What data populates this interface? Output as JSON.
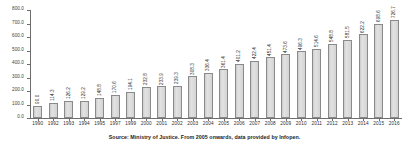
{
  "chart_data": {
    "type": "bar",
    "title": "",
    "xlabel": "",
    "ylabel": "",
    "ylim": [
      0,
      800
    ],
    "grid": false,
    "legend": "none",
    "categories": [
      "1990",
      "1992",
      "1993",
      "1994",
      "1995",
      "1997",
      "1999",
      "2000",
      "2001",
      "2002",
      "2003",
      "2004",
      "2005",
      "2006",
      "2007",
      "2008",
      "2009",
      "2010",
      "2011",
      "2012",
      "2013",
      "2014",
      "2015",
      "2016"
    ],
    "values": [
      90.0,
      114.3,
      126.2,
      129.2,
      148.8,
      170.6,
      194.1,
      232.8,
      233.9,
      239.3,
      308.3,
      336.4,
      361.4,
      401.2,
      422.4,
      451.4,
      473.6,
      496.3,
      514.6,
      548.8,
      581.5,
      622.2,
      698.6,
      726.7
    ],
    "value_labels": [
      "90.0",
      "114.3",
      "126.2",
      "129.2",
      "148.8",
      "170.6",
      "194.1",
      "232.8",
      "233.9",
      "239.3",
      "308.3",
      "336.4",
      "361.4",
      "401.2",
      "422.4",
      "451.4",
      "473.6",
      "496.3",
      "514.6",
      "548.8",
      "581.5",
      "622.2",
      "698.6",
      "726.7"
    ],
    "ytick_labels": [
      "0.0",
      "100.0",
      "200.0",
      "300.0",
      "400.0",
      "500.0",
      "600.0",
      "700.0",
      "800.0"
    ],
    "ytick_values": [
      0,
      100,
      200,
      300,
      400,
      500,
      600,
      700,
      800
    ],
    "bar_color": "#d8d8d8",
    "bar_edge_color": "#8a8a8a",
    "axis_color": "#6e6e6e"
  },
  "source_note": "Source: Ministry of Justice. From 2005 onwards, data provided by Infopen."
}
